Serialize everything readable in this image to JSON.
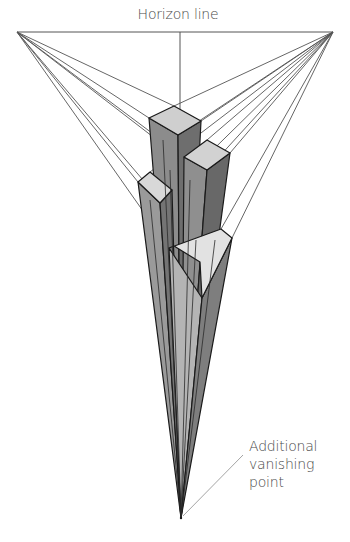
{
  "labels": {
    "horizon": "Horizon line",
    "vanishing_point": [
      "Additional",
      "vanishing",
      "point"
    ]
  },
  "colors": {
    "construction_line": "#555555",
    "outline": "#1a1a1a",
    "face_light": "#d4d4d4",
    "face_mid": "#a6a6a6",
    "face_dark": "#7a7a7a",
    "pointer_line": "#9a9a9a"
  },
  "vanishing_points": {
    "left": [
      17,
      32
    ],
    "right": [
      333,
      32
    ],
    "bottom": [
      181,
      518
    ]
  }
}
